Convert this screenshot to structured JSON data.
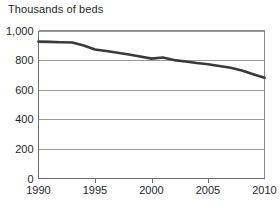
{
  "chart_data": {
    "type": "line",
    "title": "Thousands of beds",
    "xlabel": "",
    "ylabel": "",
    "ylim": [
      0,
      1000
    ],
    "xlim": [
      1990,
      2010
    ],
    "grid": true,
    "legend": false,
    "yticks": [
      "0",
      "200",
      "400",
      "600",
      "800",
      "1,000"
    ],
    "ytick_values": [
      0,
      200,
      400,
      600,
      800,
      1000
    ],
    "xticks": [
      "1990",
      "1995",
      "2000",
      "2005",
      "2010"
    ],
    "xtick_values": [
      1990,
      1995,
      2000,
      2005,
      2010
    ],
    "x": [
      1990,
      1991,
      1992,
      1993,
      1994,
      1995,
      1996,
      1997,
      1998,
      1999,
      2000,
      2001,
      2002,
      2003,
      2004,
      2005,
      2006,
      2007,
      2008,
      2009,
      2010
    ],
    "values": [
      925,
      923,
      921,
      919,
      898,
      872,
      862,
      850,
      838,
      824,
      810,
      818,
      800,
      790,
      780,
      772,
      760,
      748,
      730,
      705,
      680
    ],
    "series": [
      {
        "name": "Thousands of beds",
        "color": "#3a3a3a",
        "values": [
          925,
          923,
          921,
          919,
          898,
          872,
          862,
          850,
          838,
          824,
          810,
          818,
          800,
          790,
          780,
          772,
          760,
          748,
          730,
          705,
          680
        ]
      }
    ],
    "annotations": []
  },
  "footer": {
    "partial_text": ""
  }
}
